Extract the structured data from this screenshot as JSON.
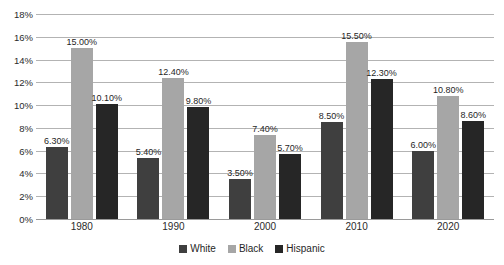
{
  "chart_data": {
    "type": "bar",
    "title": "",
    "subtitle": "",
    "xlabel": "",
    "ylabel": "",
    "categories": [
      "1980",
      "1990",
      "2000",
      "2010",
      "2020"
    ],
    "series": [
      {
        "name": "White",
        "color": "#3f3f3f",
        "values": [
          6.3,
          5.4,
          3.5,
          8.5,
          6.0
        ],
        "labels": [
          "6.30%",
          "5.40%",
          "3.50%",
          "8.50%",
          "6.00%"
        ]
      },
      {
        "name": "Black",
        "color": "#a6a6a6",
        "values": [
          15.0,
          12.4,
          7.4,
          15.5,
          10.8
        ],
        "labels": [
          "15.00%",
          "12.40%",
          "7.40%",
          "15.50%",
          "10.80%"
        ]
      },
      {
        "name": "Hispanic",
        "color": "#262626",
        "values": [
          10.1,
          9.8,
          5.7,
          12.3,
          8.6
        ],
        "labels": [
          "10.10%",
          "9.80%",
          "5.70%",
          "12.30%",
          "8.60%"
        ]
      }
    ],
    "ylim": [
      0,
      18
    ],
    "ytick_step": 2,
    "ytick_labels": [
      "0%",
      "2%",
      "4%",
      "6%",
      "8%",
      "10%",
      "12%",
      "14%",
      "16%",
      "18%"
    ],
    "grid": true,
    "legend_position": "bottom",
    "value_labels_shown": true
  }
}
